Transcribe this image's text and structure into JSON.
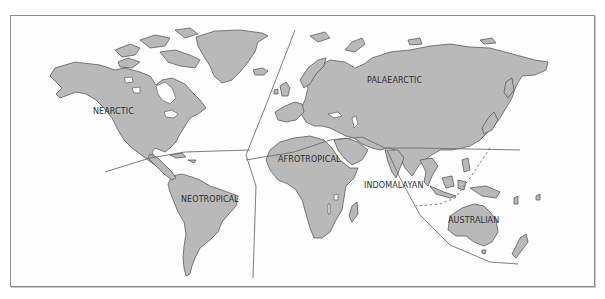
{
  "map": {
    "title": "Zoogeographic realms of the world",
    "colors": {
      "land": "#b9b9b9",
      "coast": "#4a4a4a",
      "boundary": "#6e6e6e",
      "background": "#fdfdfd",
      "frame": "#8c8c8c"
    },
    "realms": [
      {
        "id": "nearctic",
        "label": "NEARCTIC"
      },
      {
        "id": "palaearctic",
        "label": "PALAEARCTIC"
      },
      {
        "id": "neotropical",
        "label": "NEOTROPICAL"
      },
      {
        "id": "afrotropical",
        "label": "AFROTROPICAL"
      },
      {
        "id": "indomalayan",
        "label": "INDOMALAYAN"
      },
      {
        "id": "australian",
        "label": "AUSTRALIAN"
      }
    ],
    "boundaries": [
      {
        "id": "nearctic-neotropical",
        "style": "solid"
      },
      {
        "id": "atlantic-divide",
        "style": "solid"
      },
      {
        "id": "palaearctic-afrotropical",
        "style": "solid"
      },
      {
        "id": "palaearctic-indomalayan",
        "style": "solid"
      },
      {
        "id": "indomalayan-australian-outer",
        "style": "solid"
      },
      {
        "id": "wallace-line",
        "style": "dashed"
      }
    ]
  }
}
